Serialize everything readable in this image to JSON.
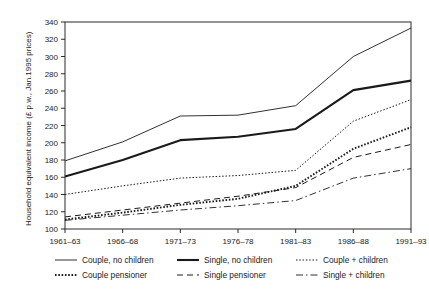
{
  "chart_data": {
    "type": "line",
    "title": "",
    "xlabel": "",
    "ylabel": "Household equivalent income (£ p.w., Jan.1995 prices)",
    "categories": [
      "1961–63",
      "1966–68",
      "1971–73",
      "1976–78",
      "1981–83",
      "1986–88",
      "1991–93"
    ],
    "ylim": [
      100,
      340
    ],
    "yticks": [
      100,
      120,
      140,
      160,
      180,
      200,
      220,
      240,
      260,
      280,
      300,
      320,
      340
    ],
    "grid": false,
    "legend_position": "bottom",
    "series": [
      {
        "name": "Couple, no children",
        "style": "thin-solid",
        "values": [
          179,
          201,
          231,
          232,
          243,
          300,
          333
        ]
      },
      {
        "name": "Single, no children",
        "style": "thick-solid",
        "values": [
          161,
          180,
          203,
          207,
          216,
          261,
          272
        ]
      },
      {
        "name": "Couple + children",
        "style": "fine-dotted",
        "values": [
          140,
          150,
          159,
          162,
          168,
          225,
          250
        ]
      },
      {
        "name": "Couple pensioner",
        "style": "thick-dotted",
        "values": [
          111,
          119,
          128,
          135,
          150,
          193,
          218
        ]
      },
      {
        "name": "Single pensioner",
        "style": "dashed",
        "values": [
          114,
          122,
          130,
          138,
          148,
          183,
          198
        ]
      },
      {
        "name": "Single + children",
        "style": "dash-dot",
        "values": [
          110,
          116,
          122,
          127,
          133,
          159,
          170
        ]
      }
    ]
  },
  "legend": {
    "items": [
      {
        "label": "Couple, no children"
      },
      {
        "label": "Single, no children"
      },
      {
        "label": "Couple + children"
      },
      {
        "label": "Couple pensioner"
      },
      {
        "label": "Single pensioner"
      },
      {
        "label": "Single + children"
      }
    ]
  },
  "colors": {
    "ink": "#1a1a1a",
    "axis": "#2b2b2b",
    "background": "#ffffff"
  }
}
